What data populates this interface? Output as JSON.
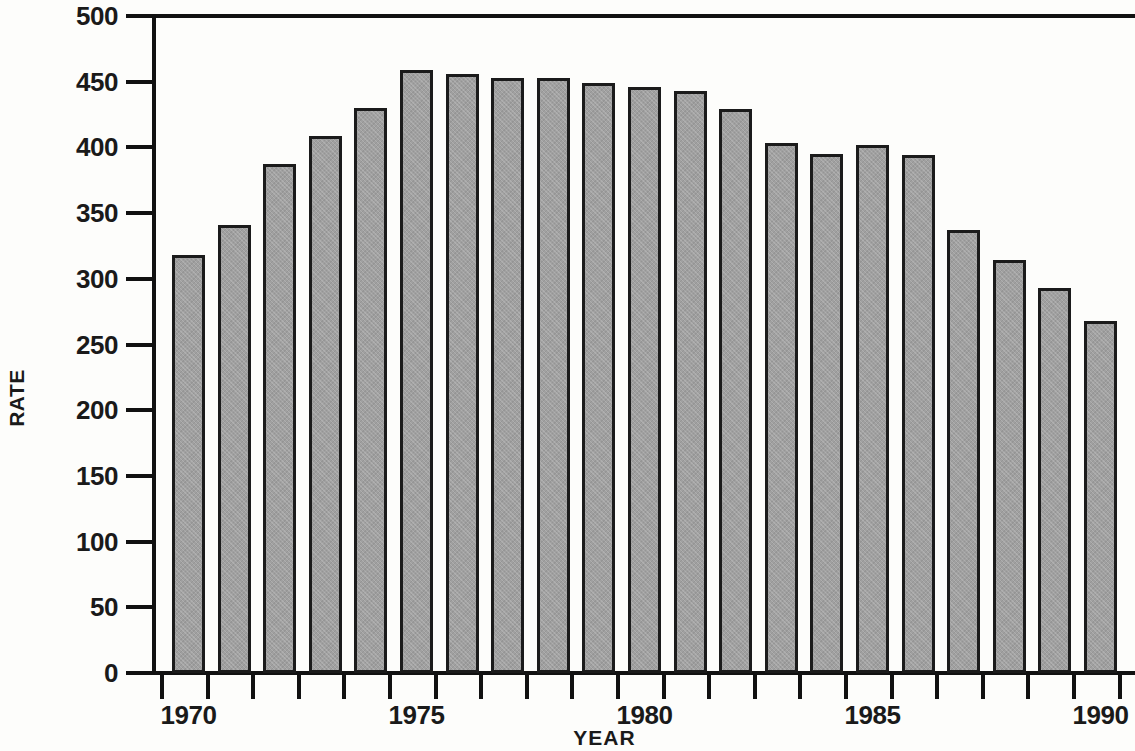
{
  "chart_data": {
    "type": "bar",
    "title": "",
    "xlabel": "YEAR",
    "ylabel": "RATE",
    "ylim": [
      0,
      500
    ],
    "ytick_values": [
      0,
      50,
      100,
      150,
      200,
      250,
      300,
      350,
      400,
      450,
      500
    ],
    "ytick_labels": [
      "0",
      "50",
      "100",
      "150",
      "200",
      "250",
      "300",
      "350",
      "400",
      "450",
      "500"
    ],
    "grid": false,
    "legend": null,
    "xtick_labels": [
      "1970",
      "1975",
      "1980",
      "1985",
      "1990"
    ],
    "xtick_label_years": [
      1970,
      1975,
      1980,
      1985,
      1990
    ],
    "categories": [
      "1970",
      "1971",
      "1972",
      "1973",
      "1974",
      "1975",
      "1976",
      "1977",
      "1978",
      "1979",
      "1980",
      "1981",
      "1982",
      "1983",
      "1984",
      "1985",
      "1986",
      "1987",
      "1988",
      "1989",
      "1990"
    ],
    "values": [
      318,
      341,
      387,
      409,
      430,
      459,
      456,
      453,
      453,
      449,
      446,
      443,
      429,
      403,
      395,
      402,
      394,
      337,
      314,
      293,
      268
    ],
    "bar_color": "#a0a0a0",
    "bar_edge_color": "#1b1b1b",
    "axis_color": "#111111",
    "background_color": "#fdfdfb"
  }
}
